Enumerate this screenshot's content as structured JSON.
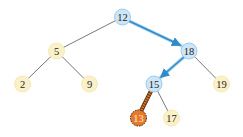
{
  "diagram": {
    "type": "binary-search-tree",
    "colors": {
      "path_node_fill": "#cde5f6",
      "path_node_stroke": "#8cc3e6",
      "normal_node_fill": "#fbf1c9",
      "normal_node_stroke": "#f3e4a8",
      "target_node_fill": "#e8792b",
      "target_node_stroke": "#5a3210",
      "path_edge": "#2f8bc9",
      "normal_edge": "#555555",
      "target_edge": "#e8792b"
    },
    "nodes": [
      {
        "id": "n12",
        "label": "12",
        "x": 122.5,
        "y": 17,
        "style": "path"
      },
      {
        "id": "n5",
        "label": "5",
        "x": 56.5,
        "y": 51,
        "style": "normal"
      },
      {
        "id": "n18",
        "label": "18",
        "x": 189,
        "y": 51,
        "style": "path"
      },
      {
        "id": "n2",
        "label": "2",
        "x": 22.5,
        "y": 84,
        "style": "normal"
      },
      {
        "id": "n9",
        "label": "9",
        "x": 89.5,
        "y": 84,
        "style": "normal"
      },
      {
        "id": "n15",
        "label": "15",
        "x": 154,
        "y": 84,
        "style": "path"
      },
      {
        "id": "n19",
        "label": "19",
        "x": 221.5,
        "y": 84,
        "style": "normal"
      },
      {
        "id": "n13",
        "label": "13",
        "x": 138.5,
        "y": 118,
        "style": "target"
      },
      {
        "id": "n17",
        "label": "17",
        "x": 171.5,
        "y": 118,
        "style": "normal"
      }
    ],
    "edges": [
      {
        "from": "n12",
        "to": "n5",
        "style": "normal"
      },
      {
        "from": "n12",
        "to": "n18",
        "style": "path"
      },
      {
        "from": "n5",
        "to": "n2",
        "style": "normal"
      },
      {
        "from": "n5",
        "to": "n9",
        "style": "normal"
      },
      {
        "from": "n18",
        "to": "n15",
        "style": "path"
      },
      {
        "from": "n18",
        "to": "n19",
        "style": "normal"
      },
      {
        "from": "n15",
        "to": "n13",
        "style": "target"
      },
      {
        "from": "n15",
        "to": "n17",
        "style": "normal"
      }
    ]
  }
}
